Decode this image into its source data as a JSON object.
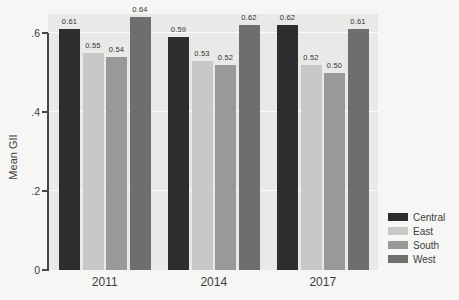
{
  "chart_data": {
    "type": "bar",
    "title": "",
    "xlabel": "",
    "ylabel": "Mean GII",
    "categories": [
      "2011",
      "2014",
      "2017"
    ],
    "series": [
      {
        "name": "Central",
        "color": "#2e2e2e",
        "values": [
          0.61,
          0.59,
          0.62
        ]
      },
      {
        "name": "East",
        "color": "#c8c8c7",
        "values": [
          0.55,
          0.53,
          0.52
        ]
      },
      {
        "name": "South",
        "color": "#999998",
        "values": [
          0.54,
          0.52,
          0.5
        ]
      },
      {
        "name": "West",
        "color": "#6e6e6d",
        "values": [
          0.64,
          0.62,
          0.61
        ]
      }
    ],
    "ylim": [
      0,
      0.648
    ],
    "yticks": [
      {
        "value": 0.0,
        "label": "0"
      },
      {
        "value": 0.2,
        "label": ".2"
      },
      {
        "value": 0.4,
        "label": ".4"
      },
      {
        "value": 0.6,
        "label": ".6"
      }
    ],
    "bar_value_labels": true,
    "value_label_decimals": 2,
    "grid": true,
    "legend_position": "bottom-right",
    "plot_bg_color": "#e9e9e8",
    "page_bg_color": "#f6f6f4",
    "axis_color": "#474747"
  }
}
